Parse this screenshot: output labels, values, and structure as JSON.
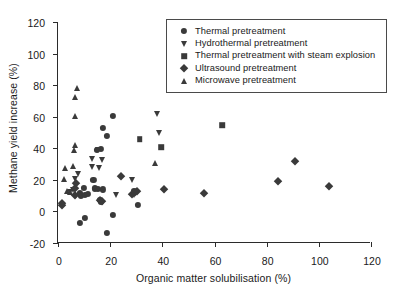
{
  "chart_data": {
    "type": "scatter",
    "title": "",
    "xlabel": "Organic matter solubilisation (%)",
    "ylabel": "Methane yield increase (%)",
    "xlim": [
      0,
      120
    ],
    "ylim": [
      -20,
      120
    ],
    "xticks": [
      0,
      20,
      40,
      60,
      80,
      100,
      120
    ],
    "yticks": [
      -20,
      0,
      20,
      40,
      60,
      80,
      100,
      120
    ],
    "grid": false,
    "legend_position": "top-right-inside",
    "marker_color": "#3a3a3a",
    "series": [
      {
        "name": "Thermal pretreatment",
        "marker": "circle",
        "points": [
          [
            21.0,
            60.5
          ],
          [
            17.3,
            52.8
          ],
          [
            18.6,
            47.8
          ],
          [
            16.6,
            39.8
          ],
          [
            14.9,
            39.2
          ],
          [
            13.6,
            20.0
          ],
          [
            14.2,
            14.6
          ],
          [
            15.2,
            14.2
          ],
          [
            17.2,
            13.9
          ],
          [
            9.9,
            14.9
          ],
          [
            8.4,
            11.5
          ],
          [
            8.9,
            10.2
          ],
          [
            10.3,
            10.3
          ],
          [
            16.0,
            7.2
          ],
          [
            16.4,
            6.3
          ],
          [
            11.6,
            10.9
          ],
          [
            21.0,
            -2.2
          ],
          [
            10.2,
            -4.2
          ],
          [
            8.4,
            -7.2
          ],
          [
            18.6,
            -13.5
          ],
          [
            30.5,
            4.0
          ],
          [
            29.2,
            12.9
          ]
        ]
      },
      {
        "name": "Hydrothermal pretreatment",
        "marker": "triangle-down",
        "points": [
          [
            37.8,
            61.5
          ],
          [
            38.6,
            49.6
          ],
          [
            13.0,
            33.0
          ],
          [
            16.8,
            32.8
          ],
          [
            15.4,
            39.0
          ],
          [
            13.1,
            28.0
          ],
          [
            15.9,
            27.6
          ],
          [
            7.7,
            24.0
          ],
          [
            6.6,
            20.7
          ],
          [
            28.3,
            19.6
          ],
          [
            22.4,
            10.5
          ],
          [
            29.0,
            10.6
          ],
          [
            5.8,
            13.3
          ],
          [
            4.5,
            12.6
          ]
        ]
      },
      {
        "name": "Thermal pretreatment with steam explosion",
        "marker": "square",
        "points": [
          [
            63.0,
            54.8
          ],
          [
            31.3,
            45.6
          ],
          [
            39.6,
            40.6
          ]
        ]
      },
      {
        "name": "Ultrasound pretreatment",
        "marker": "diamond",
        "points": [
          [
            90.9,
            32.2
          ],
          [
            84.2,
            19.5
          ],
          [
            103.8,
            16.2
          ],
          [
            55.8,
            11.4
          ],
          [
            40.8,
            14.5
          ],
          [
            24.0,
            22.7
          ],
          [
            28.3,
            11.2
          ],
          [
            29.4,
            12.6
          ],
          [
            30.3,
            12.9
          ],
          [
            16.2,
            7.0
          ],
          [
            16.8,
            6.9
          ],
          [
            7.0,
            17.8
          ],
          [
            6.6,
            15.0
          ],
          [
            6.5,
            10.2
          ],
          [
            1.5,
            5.2
          ],
          [
            1.7,
            4.3
          ]
        ]
      },
      {
        "name": "Microwave pretreatment",
        "marker": "triangle-up",
        "points": [
          [
            7.4,
            78.4
          ],
          [
            6.6,
            72.4
          ],
          [
            6.5,
            60.3
          ],
          [
            6.4,
            41.8
          ],
          [
            6.3,
            38.8
          ],
          [
            2.7,
            27.7
          ],
          [
            5.6,
            28.9
          ],
          [
            2.4,
            20.6
          ],
          [
            37.3,
            30.5
          ],
          [
            3.6,
            13.0
          ],
          [
            4.6,
            12.6
          ]
        ]
      }
    ]
  }
}
